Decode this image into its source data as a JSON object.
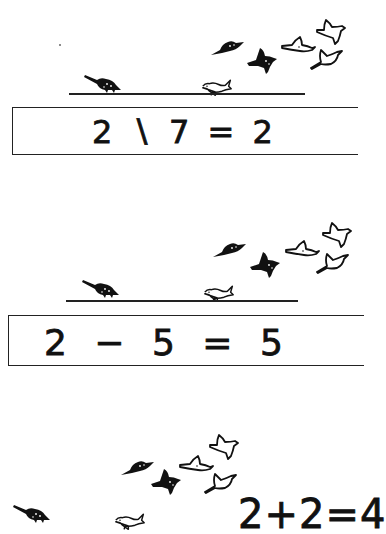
{
  "worksheet": {
    "panels": [
      {
        "equation": "2 ∖ 7 = 2",
        "birds_on_wire": 2,
        "birds_flying": 5,
        "operation": "subtraction",
        "boxed": true
      },
      {
        "equation": "2 − 5 = 5",
        "birds_on_wire": 2,
        "birds_flying": 5,
        "operation": "subtraction",
        "boxed": true
      },
      {
        "equation": "2+2=4",
        "birds_on_wire": 2,
        "birds_flying": 5,
        "operation": "addition",
        "boxed": false
      }
    ],
    "icons": {
      "dark_bird": "dark-bird-icon",
      "light_bird": "light-bird-icon"
    },
    "colors": {
      "ink": "#111111",
      "paper": "#ffffff"
    }
  }
}
